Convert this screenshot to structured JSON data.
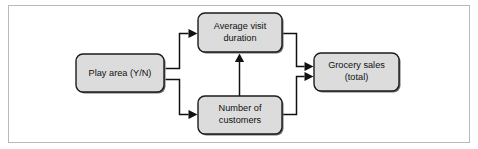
{
  "figure": {
    "kind": "causal-path-diagram",
    "border_color": "#b9b9b9",
    "background_color": "#ffffff",
    "node_fill": "#dcdcdc",
    "node_stroke": "#1b1b1b",
    "edge_color": "#111111"
  },
  "nodes": [
    {
      "id": "play-area",
      "line1": "Play area (Y/N)",
      "line2": ""
    },
    {
      "id": "average-visit-duration",
      "line1": "Average visit",
      "line2": "duration"
    },
    {
      "id": "number-of-customers",
      "line1": "Number of",
      "line2": "customers"
    },
    {
      "id": "grocery-sales",
      "line1": "Grocery sales",
      "line2": "(total)"
    }
  ],
  "edges": [
    {
      "id": "play-area-to-average-visit-duration",
      "from": "play-area",
      "to": "average-visit-duration"
    },
    {
      "id": "play-area-to-number-of-customers",
      "from": "play-area",
      "to": "number-of-customers"
    },
    {
      "id": "number-of-customers-to-average-visit-duration",
      "from": "number-of-customers",
      "to": "average-visit-duration"
    },
    {
      "id": "average-visit-duration-to-grocery-sales",
      "from": "average-visit-duration",
      "to": "grocery-sales"
    },
    {
      "id": "number-of-customers-to-grocery-sales",
      "from": "number-of-customers",
      "to": "grocery-sales"
    }
  ]
}
